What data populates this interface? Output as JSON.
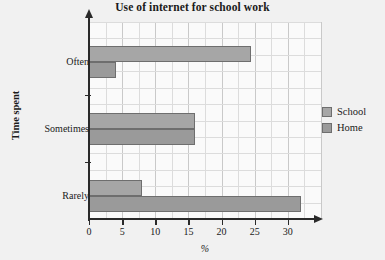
{
  "chart_data": {
    "type": "bar",
    "orientation": "horizontal",
    "title": "Use of internet for school work",
    "xlabel": "%",
    "ylabel": "Time spent",
    "categories": [
      "Often",
      "Sometimes",
      "Rarely"
    ],
    "series": [
      {
        "name": "School",
        "values": [
          24.5,
          16,
          8
        ],
        "color": "#a6a6a6"
      },
      {
        "name": "Home",
        "values": [
          4,
          16,
          32
        ],
        "color": "#9a9a9a"
      }
    ],
    "xlim": [
      0,
      35
    ],
    "xticks": [
      0,
      5,
      10,
      15,
      20,
      25,
      30
    ],
    "xtick_labels": [
      "0",
      "5",
      "10",
      "15",
      "20",
      "25",
      "30"
    ],
    "grid": true,
    "legend_position": "right"
  },
  "legend": {
    "items": [
      {
        "label": "School"
      },
      {
        "label": "Home"
      }
    ]
  }
}
